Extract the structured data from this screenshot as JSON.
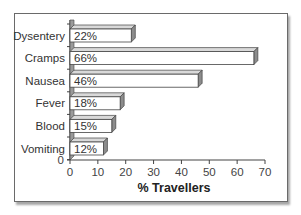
{
  "chart_data": {
    "type": "bar",
    "orientation": "horizontal",
    "style": "3d",
    "title": "",
    "categories": [
      "Dysentery",
      "Cramps",
      "Nausea",
      "Fever",
      "Blood",
      "Vomiting"
    ],
    "values": [
      22,
      66,
      46,
      18,
      15,
      12
    ],
    "data_labels": [
      "22%",
      "66%",
      "46%",
      "18%",
      "15%",
      "12%"
    ],
    "xlabel": "% Travellers",
    "ylabel": "",
    "xlim": [
      0,
      70
    ],
    "x_ticks": [
      0,
      10,
      20,
      30,
      40,
      50,
      60,
      70
    ],
    "y_origin_label": "0",
    "grid": false,
    "legend": null,
    "colors": {
      "bar_face": "#ffffff",
      "bar_top": "#d9d9d9",
      "bar_side": "#8c8c8c",
      "axis": "#444444",
      "frame": "#6a6a6a"
    }
  }
}
